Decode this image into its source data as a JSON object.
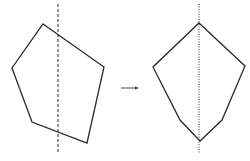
{
  "diagram": {
    "stroke_color": "#2a2a2a",
    "left_figure": {
      "polygon": [
        [
          43,
          24
        ],
        [
          104,
          67
        ],
        [
          87,
          143
        ],
        [
          32,
          122
        ],
        [
          12,
          68
        ]
      ],
      "axis_line": {
        "x": 58,
        "y1": 4,
        "y2": 154,
        "style": "dashed"
      }
    },
    "arrow": {
      "x1": 121,
      "x2": 139,
      "y": 88
    },
    "right_figure": {
      "polygon": [
        [
          199,
          23
        ],
        [
          245,
          66
        ],
        [
          222,
          120
        ],
        [
          200,
          141
        ],
        [
          180,
          120
        ],
        [
          153,
          67
        ]
      ],
      "axis_line": {
        "x": 199,
        "y1": 4,
        "y2": 154,
        "style": "dotted"
      }
    }
  }
}
